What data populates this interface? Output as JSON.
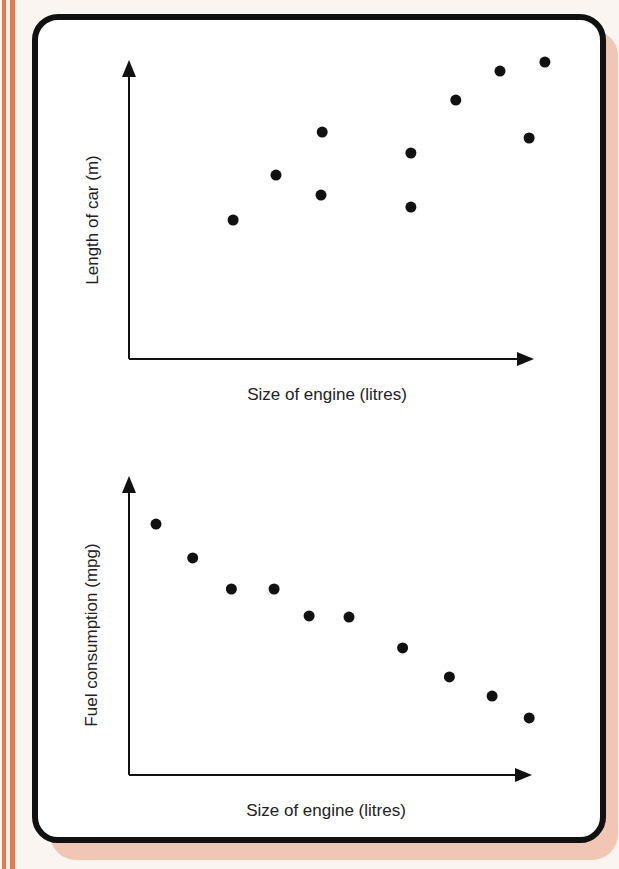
{
  "colors": {
    "background": "#faf5f0",
    "stripe": "#e8784a",
    "card_shadow": "#f2c6b4",
    "card_border": "#111111",
    "ink": "#111111"
  },
  "chart_data": [
    {
      "type": "scatter",
      "title": "",
      "xlabel": "Size of engine (litres)",
      "ylabel": "Length of car (m)",
      "grid": false,
      "ticks": "none",
      "note": "Values are relative positions (0-100) along unlabeled axes",
      "points": [
        {
          "x": 25.7,
          "y": 46.5
        },
        {
          "x": 36.3,
          "y": 61.5
        },
        {
          "x": 47.7,
          "y": 75.9
        },
        {
          "x": 47.4,
          "y": 54.8
        },
        {
          "x": 69.6,
          "y": 68.9
        },
        {
          "x": 69.6,
          "y": 50.8
        },
        {
          "x": 80.7,
          "y": 86.6
        },
        {
          "x": 91.6,
          "y": 96.3
        },
        {
          "x": 102.7,
          "y": 99.3
        },
        {
          "x": 98.8,
          "y": 73.9
        }
      ],
      "trend": "positive correlation"
    },
    {
      "type": "scatter",
      "title": "",
      "xlabel": "Size of engine (litres)",
      "ylabel": "Fuel consumption (mpg)",
      "grid": false,
      "ticks": "none",
      "note": "Values are relative positions (0-100) along unlabeled axes",
      "points": [
        {
          "x": 6.7,
          "y": 83.9
        },
        {
          "x": 15.8,
          "y": 72.6
        },
        {
          "x": 25.4,
          "y": 62.2
        },
        {
          "x": 36.0,
          "y": 62.2
        },
        {
          "x": 44.7,
          "y": 53.2
        },
        {
          "x": 54.6,
          "y": 52.8
        },
        {
          "x": 67.9,
          "y": 42.5
        },
        {
          "x": 79.5,
          "y": 32.8
        },
        {
          "x": 90.1,
          "y": 26.4
        },
        {
          "x": 99.3,
          "y": 19.1
        }
      ],
      "trend": "negative correlation"
    }
  ],
  "plots": [
    {
      "origin": [
        129,
        359
      ],
      "x_end": 534,
      "y_top": 60,
      "xlabel_pos": [
        327,
        400
      ],
      "ylabel_pos": [
        98,
        220
      ]
    },
    {
      "origin": [
        129,
        775
      ],
      "x_end": 532,
      "y_top": 476,
      "xlabel_pos": [
        326,
        816
      ],
      "ylabel_pos": [
        97,
        635
      ]
    }
  ]
}
